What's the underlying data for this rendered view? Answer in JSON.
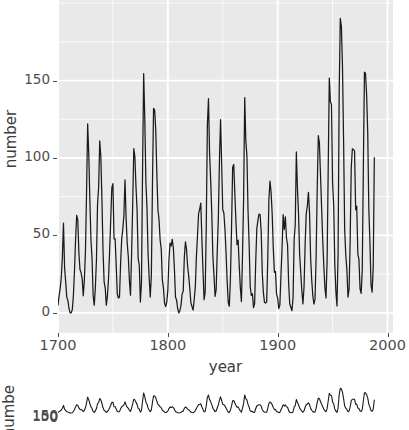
{
  "chart_data": [
    {
      "type": "line",
      "title": "",
      "xlabel": "year",
      "ylabel": "number",
      "xlim": [
        1700,
        2005
      ],
      "ylim": [
        -13,
        202
      ],
      "grid": true,
      "legend": "none",
      "line_color": "#1a1a1a",
      "panel_bg": "#e9e9e9",
      "grid_color": "#ffffff",
      "xticks": [
        1700,
        1800,
        1900,
        2000
      ],
      "xticklabels": [
        "1700",
        "1800",
        "1900",
        "2000"
      ],
      "yticks": [
        0,
        50,
        100,
        150
      ],
      "yticklabels": [
        "0",
        "50",
        "100",
        "150"
      ],
      "note": "Annual sunspot numbers, 1700-1988. Top panel is fully visible; x tick label 2000 is clipped at the right image edge.",
      "x": [
        1700,
        1701,
        1702,
        1703,
        1704,
        1705,
        1706,
        1707,
        1708,
        1709,
        1710,
        1711,
        1712,
        1713,
        1714,
        1715,
        1716,
        1717,
        1718,
        1719,
        1720,
        1721,
        1722,
        1723,
        1724,
        1725,
        1726,
        1727,
        1728,
        1729,
        1730,
        1731,
        1732,
        1733,
        1734,
        1735,
        1736,
        1737,
        1738,
        1739,
        1740,
        1741,
        1742,
        1743,
        1744,
        1745,
        1746,
        1747,
        1748,
        1749,
        1750,
        1751,
        1752,
        1753,
        1754,
        1755,
        1756,
        1757,
        1758,
        1759,
        1760,
        1761,
        1762,
        1763,
        1764,
        1765,
        1766,
        1767,
        1768,
        1769,
        1770,
        1771,
        1772,
        1773,
        1774,
        1775,
        1776,
        1777,
        1778,
        1779,
        1780,
        1781,
        1782,
        1783,
        1784,
        1785,
        1786,
        1787,
        1788,
        1789,
        1790,
        1791,
        1792,
        1793,
        1794,
        1795,
        1796,
        1797,
        1798,
        1799,
        1800,
        1801,
        1802,
        1803,
        1804,
        1805,
        1806,
        1807,
        1808,
        1809,
        1810,
        1811,
        1812,
        1813,
        1814,
        1815,
        1816,
        1817,
        1818,
        1819,
        1820,
        1821,
        1822,
        1823,
        1824,
        1825,
        1826,
        1827,
        1828,
        1829,
        1830,
        1831,
        1832,
        1833,
        1834,
        1835,
        1836,
        1837,
        1838,
        1839,
        1840,
        1841,
        1842,
        1843,
        1844,
        1845,
        1846,
        1847,
        1848,
        1849,
        1850,
        1851,
        1852,
        1853,
        1854,
        1855,
        1856,
        1857,
        1858,
        1859,
        1860,
        1861,
        1862,
        1863,
        1864,
        1865,
        1866,
        1867,
        1868,
        1869,
        1870,
        1871,
        1872,
        1873,
        1874,
        1875,
        1876,
        1877,
        1878,
        1879,
        1880,
        1881,
        1882,
        1883,
        1884,
        1885,
        1886,
        1887,
        1888,
        1889,
        1890,
        1891,
        1892,
        1893,
        1894,
        1895,
        1896,
        1897,
        1898,
        1899,
        1900,
        1901,
        1902,
        1903,
        1904,
        1905,
        1906,
        1907,
        1908,
        1909,
        1910,
        1911,
        1912,
        1913,
        1914,
        1915,
        1916,
        1917,
        1918,
        1919,
        1920,
        1921,
        1922,
        1923,
        1924,
        1925,
        1926,
        1927,
        1928,
        1929,
        1930,
        1931,
        1932,
        1933,
        1934,
        1935,
        1936,
        1937,
        1938,
        1939,
        1940,
        1941,
        1942,
        1943,
        1944,
        1945,
        1946,
        1947,
        1948,
        1949,
        1950,
        1951,
        1952,
        1953,
        1954,
        1955,
        1956,
        1957,
        1958,
        1959,
        1960,
        1961,
        1962,
        1963,
        1964,
        1965,
        1966,
        1967,
        1968,
        1969,
        1970,
        1971,
        1972,
        1973,
        1974,
        1975,
        1976,
        1977,
        1978,
        1979,
        1980,
        1981,
        1982,
        1983,
        1984,
        1985,
        1986,
        1987,
        1988
      ],
      "values": [
        5,
        11,
        16,
        23,
        36,
        58,
        29,
        20,
        10,
        8,
        3,
        0,
        0,
        2,
        11,
        27,
        47,
        63,
        60,
        39,
        28,
        26,
        22,
        11,
        21,
        40,
        78,
        122,
        103,
        73,
        47,
        35,
        11,
        5,
        16,
        34,
        70,
        81,
        111,
        101,
        73,
        40,
        20,
        16,
        5,
        11,
        22,
        40,
        60,
        80.9,
        83.4,
        47.7,
        47.8,
        30.7,
        12.2,
        9.6,
        10.2,
        32.4,
        47.6,
        54,
        62.9,
        85.9,
        61.2,
        45.1,
        36.4,
        20.9,
        11.4,
        37.8,
        69.8,
        106.1,
        100.8,
        81.6,
        66.5,
        34.8,
        30.6,
        7,
        19.8,
        92.5,
        154.4,
        125.9,
        84.8,
        68.1,
        38.5,
        22.8,
        10.2,
        24.1,
        82.9,
        132,
        130.9,
        118.1,
        89.9,
        66.6,
        60,
        46.9,
        41,
        21.3,
        16,
        6.4,
        4.1,
        6.8,
        14.5,
        34,
        45,
        43.1,
        47.5,
        42.2,
        28.1,
        10.1,
        8.1,
        2.5,
        0,
        1.4,
        5,
        12.2,
        13.9,
        35.4,
        45.8,
        41.1,
        30.1,
        23.9,
        15.6,
        6.6,
        4,
        1.8,
        8.5,
        16.6,
        36.3,
        49.6,
        64.2,
        67,
        70.9,
        47.8,
        27.5,
        8.5,
        13.2,
        56.9,
        121.5,
        138.3,
        103.2,
        85.7,
        64.6,
        36.7,
        24.2,
        10.7,
        15,
        40.1,
        61.5,
        98.5,
        124.7,
        96.3,
        66.6,
        64.5,
        54.1,
        39,
        20.6,
        6.7,
        4.3,
        22.7,
        54.8,
        93.8,
        95.8,
        77.2,
        59.1,
        44,
        47,
        30.5,
        16.3,
        7.3,
        37.6,
        74,
        139,
        111.2,
        101.6,
        66.2,
        44.7,
        17,
        11.3,
        12.4,
        3.4,
        6,
        32.3,
        54.3,
        59.7,
        63.7,
        63.5,
        52.2,
        25.4,
        13.1,
        6.8,
        6.3,
        7.1,
        35.6,
        73,
        85.1,
        78,
        64,
        41.8,
        26.2,
        26.7,
        12.1,
        9.5,
        2.7,
        5,
        24.4,
        42,
        63.5,
        53.8,
        62,
        48.5,
        43.9,
        18.6,
        5.7,
        3.6,
        1.4,
        9.6,
        47.4,
        57.1,
        103.9,
        80.6,
        63.6,
        37.6,
        26.1,
        14.2,
        5.8,
        16.7,
        44.3,
        63.9,
        69,
        77.8,
        64.9,
        35.7,
        21.2,
        11.1,
        5.7,
        8.7,
        36.1,
        79.7,
        114.4,
        109.6,
        88.8,
        67.8,
        47.5,
        30.6,
        16.3,
        9.6,
        33.2,
        92.6,
        151.6,
        136.3,
        134.7,
        83.9,
        69.4,
        31.5,
        13.9,
        4.4,
        38,
        141.7,
        190.2,
        184.8,
        159,
        112.3,
        53.9,
        37.5,
        27.9,
        10.2,
        15.1,
        47,
        93.8,
        105.9,
        105.5,
        104.5,
        66.6,
        68.9,
        38,
        34.5,
        15.5,
        12.6,
        27.5,
        92.5,
        155.4,
        154.6,
        140.4,
        115.9,
        66.6,
        45.9,
        17.9,
        13.4,
        29.4,
        100.2
      ]
    },
    {
      "type": "line",
      "title": "",
      "xlabel": "",
      "ylabel": "number",
      "yticklabels": [
        "150",
        "100",
        "50",
        "0"
      ],
      "note": "Second panel, clipped by the bottom edge of the screenshot. Same sunspot series rendered with a compressed vertical scale; its y tick labels overlap into an unreadable stack.",
      "grid": false,
      "line_color": "#1a1a1a",
      "panel_bg": "#ffffff"
    }
  ],
  "main": {
    "y_axis_title": "number",
    "x_axis_title": "year",
    "y_tick_labels": [
      "150",
      "100",
      "50",
      "0"
    ],
    "x_tick_labels": [
      "1700",
      "1800",
      "1900",
      "2000"
    ]
  },
  "second": {
    "y_axis_title": "number",
    "y_tick_labels_overlapped": "150"
  }
}
